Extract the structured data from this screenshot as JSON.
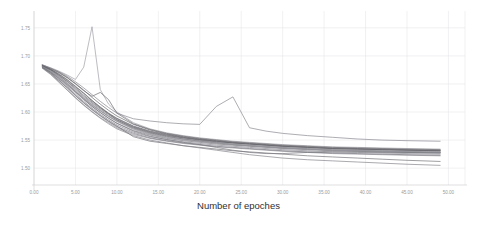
{
  "chart_data": {
    "type": "line",
    "title": "",
    "xlabel": "Number of epoches",
    "ylabel": "",
    "xlim": [
      0,
      52
    ],
    "ylim": [
      1.47,
      1.78
    ],
    "grid": true,
    "legend": "none",
    "xticks": [
      "0.00",
      "5.00",
      "10.00",
      "15.00",
      "20.00",
      "25.00",
      "30.00",
      "35.00",
      "40.00",
      "45.00",
      "50.00"
    ],
    "xtick_values": [
      0,
      5,
      10,
      15,
      20,
      25,
      30,
      35,
      40,
      45,
      50
    ],
    "yticks": [
      "1.75",
      "1.70",
      "1.65",
      "1.60",
      "1.55",
      "1.50"
    ],
    "ytick_values": [
      1.75,
      1.7,
      1.65,
      1.6,
      1.55,
      1.5
    ],
    "x": [
      1,
      2,
      3,
      4,
      5,
      6,
      7,
      8,
      9,
      10,
      12,
      14,
      16,
      18,
      20,
      22,
      24,
      26,
      28,
      30,
      33,
      36,
      39,
      42,
      45,
      49
    ],
    "series": [
      {
        "name": "run-01",
        "color": "#6e6e72",
        "values": [
          1.683,
          1.676,
          1.668,
          1.658,
          1.646,
          1.634,
          1.621,
          1.608,
          1.597,
          1.586,
          1.572,
          1.563,
          1.557,
          1.552,
          1.548,
          1.545,
          1.542,
          1.54,
          1.538,
          1.536,
          1.534,
          1.532,
          1.531,
          1.53,
          1.529,
          1.528
        ]
      },
      {
        "name": "run-02",
        "color": "#747478",
        "values": [
          1.681,
          1.673,
          1.663,
          1.651,
          1.637,
          1.623,
          1.61,
          1.599,
          1.589,
          1.58,
          1.567,
          1.559,
          1.553,
          1.549,
          1.546,
          1.543,
          1.541,
          1.539,
          1.537,
          1.535,
          1.533,
          1.531,
          1.53,
          1.529,
          1.528,
          1.527
        ]
      },
      {
        "name": "run-03",
        "color": "#5f5f64",
        "values": [
          1.684,
          1.678,
          1.671,
          1.662,
          1.651,
          1.639,
          1.626,
          1.614,
          1.603,
          1.593,
          1.578,
          1.568,
          1.561,
          1.556,
          1.552,
          1.549,
          1.546,
          1.544,
          1.542,
          1.54,
          1.538,
          1.536,
          1.535,
          1.534,
          1.533,
          1.532
        ]
      },
      {
        "name": "run-04",
        "color": "#80808a",
        "values": [
          1.68,
          1.671,
          1.659,
          1.646,
          1.632,
          1.619,
          1.607,
          1.596,
          1.586,
          1.577,
          1.564,
          1.556,
          1.551,
          1.547,
          1.544,
          1.541,
          1.539,
          1.537,
          1.535,
          1.533,
          1.531,
          1.529,
          1.528,
          1.527,
          1.526,
          1.525
        ]
      },
      {
        "name": "run-05",
        "color": "#6a6a70",
        "values": [
          1.682,
          1.675,
          1.665,
          1.654,
          1.641,
          1.628,
          1.616,
          1.605,
          1.595,
          1.586,
          1.573,
          1.564,
          1.558,
          1.554,
          1.55,
          1.547,
          1.545,
          1.543,
          1.541,
          1.539,
          1.537,
          1.535,
          1.534,
          1.533,
          1.532,
          1.531
        ]
      },
      {
        "name": "run-06",
        "color": "#888890",
        "values": [
          1.679,
          1.668,
          1.654,
          1.64,
          1.626,
          1.613,
          1.601,
          1.59,
          1.581,
          1.572,
          1.56,
          1.553,
          1.548,
          1.544,
          1.541,
          1.538,
          1.536,
          1.534,
          1.532,
          1.53,
          1.528,
          1.526,
          1.525,
          1.524,
          1.523,
          1.522
        ]
      },
      {
        "name": "run-07-spike-early",
        "color": "#9a9aa2",
        "values": [
          1.684,
          1.679,
          1.673,
          1.666,
          1.658,
          1.68,
          1.752,
          1.64,
          1.614,
          1.6,
          1.581,
          1.57,
          1.563,
          1.558,
          1.554,
          1.551,
          1.548,
          1.546,
          1.544,
          1.542,
          1.54,
          1.538,
          1.537,
          1.536,
          1.535,
          1.534
        ]
      },
      {
        "name": "run-08",
        "color": "#65656b",
        "values": [
          1.683,
          1.677,
          1.67,
          1.661,
          1.65,
          1.638,
          1.628,
          1.635,
          1.622,
          1.598,
          1.579,
          1.569,
          1.562,
          1.557,
          1.553,
          1.55,
          1.547,
          1.545,
          1.543,
          1.541,
          1.539,
          1.537,
          1.536,
          1.535,
          1.534,
          1.533
        ]
      },
      {
        "name": "run-09",
        "color": "#7a7a80",
        "values": [
          1.681,
          1.672,
          1.661,
          1.649,
          1.636,
          1.624,
          1.612,
          1.602,
          1.592,
          1.584,
          1.571,
          1.562,
          1.556,
          1.552,
          1.549,
          1.546,
          1.543,
          1.541,
          1.539,
          1.537,
          1.535,
          1.533,
          1.532,
          1.531,
          1.53,
          1.529
        ]
      },
      {
        "name": "run-10-low",
        "color": "#6c6c72",
        "values": [
          1.68,
          1.67,
          1.657,
          1.644,
          1.63,
          1.617,
          1.605,
          1.594,
          1.584,
          1.575,
          1.556,
          1.548,
          1.544,
          1.54,
          1.537,
          1.534,
          1.531,
          1.529,
          1.527,
          1.525,
          1.522,
          1.52,
          1.518,
          1.516,
          1.514,
          1.512
        ]
      },
      {
        "name": "run-11",
        "color": "#8e8e96",
        "values": [
          1.682,
          1.674,
          1.664,
          1.652,
          1.639,
          1.626,
          1.614,
          1.603,
          1.593,
          1.584,
          1.57,
          1.561,
          1.555,
          1.551,
          1.548,
          1.545,
          1.542,
          1.54,
          1.538,
          1.536,
          1.534,
          1.532,
          1.531,
          1.53,
          1.529,
          1.528
        ]
      },
      {
        "name": "run-12-bump-mid",
        "color": "#83838b",
        "values": [
          1.684,
          1.678,
          1.672,
          1.664,
          1.654,
          1.643,
          1.631,
          1.619,
          1.608,
          1.598,
          1.588,
          1.584,
          1.581,
          1.579,
          1.578,
          1.61,
          1.627,
          1.572,
          1.566,
          1.562,
          1.558,
          1.555,
          1.552,
          1.55,
          1.549,
          1.548
        ]
      },
      {
        "name": "run-13",
        "color": "#71717a",
        "values": [
          1.679,
          1.669,
          1.656,
          1.643,
          1.629,
          1.616,
          1.604,
          1.593,
          1.583,
          1.574,
          1.562,
          1.554,
          1.549,
          1.545,
          1.542,
          1.539,
          1.537,
          1.535,
          1.533,
          1.531,
          1.529,
          1.527,
          1.526,
          1.525,
          1.524,
          1.523
        ]
      },
      {
        "name": "run-14",
        "color": "#5c5c62",
        "values": [
          1.683,
          1.676,
          1.667,
          1.657,
          1.645,
          1.633,
          1.62,
          1.609,
          1.598,
          1.589,
          1.575,
          1.566,
          1.56,
          1.555,
          1.551,
          1.548,
          1.545,
          1.543,
          1.541,
          1.539,
          1.537,
          1.535,
          1.534,
          1.533,
          1.532,
          1.531
        ]
      },
      {
        "name": "run-15",
        "color": "#9696a0",
        "values": [
          1.681,
          1.673,
          1.662,
          1.65,
          1.637,
          1.625,
          1.613,
          1.602,
          1.592,
          1.583,
          1.569,
          1.56,
          1.554,
          1.55,
          1.547,
          1.544,
          1.542,
          1.54,
          1.538,
          1.536,
          1.534,
          1.532,
          1.531,
          1.53,
          1.529,
          1.528
        ]
      },
      {
        "name": "run-16-dip",
        "color": "#77777e",
        "values": [
          1.68,
          1.671,
          1.66,
          1.648,
          1.635,
          1.622,
          1.61,
          1.599,
          1.589,
          1.58,
          1.566,
          1.557,
          1.551,
          1.546,
          1.542,
          1.537,
          1.532,
          1.528,
          1.526,
          1.526,
          1.528,
          1.529,
          1.529,
          1.528,
          1.528,
          1.527
        ]
      },
      {
        "name": "run-17",
        "color": "#696970",
        "values": [
          1.682,
          1.675,
          1.666,
          1.655,
          1.643,
          1.63,
          1.618,
          1.607,
          1.597,
          1.588,
          1.574,
          1.565,
          1.559,
          1.554,
          1.551,
          1.548,
          1.545,
          1.543,
          1.541,
          1.539,
          1.537,
          1.535,
          1.534,
          1.533,
          1.532,
          1.531
        ]
      },
      {
        "name": "run-18-lowest",
        "color": "#7e7e86",
        "values": [
          1.678,
          1.667,
          1.653,
          1.639,
          1.625,
          1.612,
          1.6,
          1.589,
          1.579,
          1.57,
          1.558,
          1.55,
          1.545,
          1.54,
          1.536,
          1.532,
          1.528,
          1.524,
          1.521,
          1.518,
          1.515,
          1.513,
          1.511,
          1.509,
          1.507,
          1.505
        ]
      }
    ],
    "notes": [
      "Dense bundle of ~18 overlapping grey loss curves",
      "Sharp spike to ~1.75 near epoch 7",
      "Secondary bump to ~1.63 near epoch 23-24",
      "All curves truncate at epoch ~49"
    ]
  }
}
